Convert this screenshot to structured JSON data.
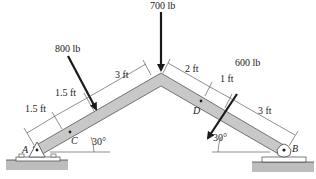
{
  "loads": {
    "top": "700 lb",
    "left": "800 lb",
    "right": "600 lb"
  },
  "dimensions": {
    "left_upper": "3 ft",
    "left_mid": "1.5 ft",
    "left_lower": "1.5 ft",
    "right_upper": "2 ft",
    "right_mid": "1 ft",
    "right_lower": "3 ft"
  },
  "angles": {
    "left": "30°",
    "right": "30°"
  },
  "points": {
    "A": "A",
    "B": "B",
    "C": "C",
    "D": "D"
  },
  "colors": {
    "beam_fill": "#c8c8c8",
    "beam_stroke": "#555555",
    "ground": "#bdbdbd",
    "arrow": "#1a1a1a"
  }
}
